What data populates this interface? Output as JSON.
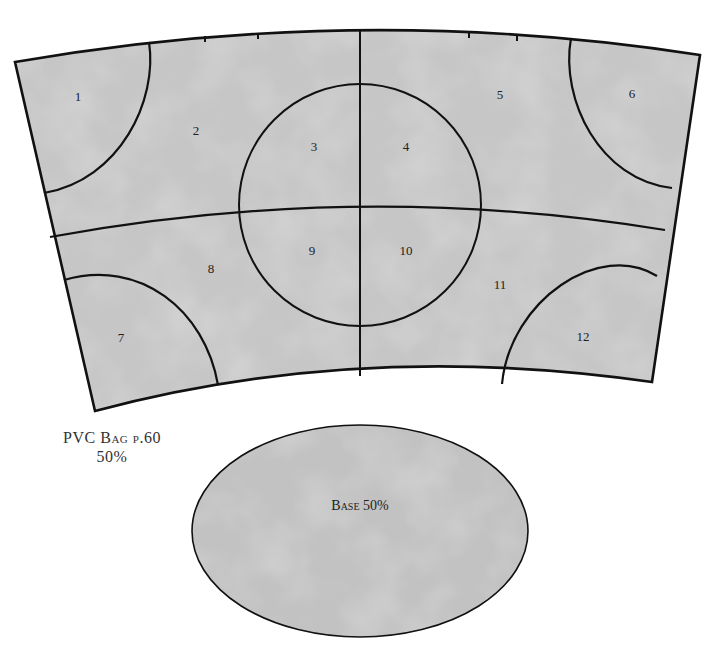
{
  "diagram": {
    "title_line1": "PVC Bag p.60",
    "title_line2": "50%",
    "base_label": "Base 50%",
    "colors": {
      "fill": "#c4c4c4",
      "stroke": "#111111",
      "background": "#ffffff"
    },
    "pieces": [
      {
        "id": "1",
        "label": "1"
      },
      {
        "id": "2",
        "label": "2"
      },
      {
        "id": "3",
        "label": "3"
      },
      {
        "id": "4",
        "label": "4"
      },
      {
        "id": "5",
        "label": "5"
      },
      {
        "id": "6",
        "label": "6"
      },
      {
        "id": "7",
        "label": "7"
      },
      {
        "id": "8",
        "label": "8"
      },
      {
        "id": "9",
        "label": "9"
      },
      {
        "id": "10",
        "label": "10"
      },
      {
        "id": "11",
        "label": "11"
      },
      {
        "id": "12",
        "label": "12"
      }
    ]
  }
}
